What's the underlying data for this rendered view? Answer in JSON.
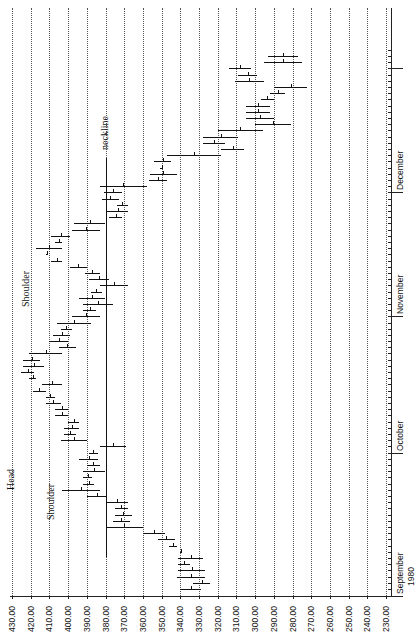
{
  "chart_data": {
    "type": "bar",
    "subtype": "high-low range (OHLC-style) chart, rotated 90 degrees: price on horizontal axis, time on vertical axis",
    "title": "",
    "xlabel": "",
    "ylabel": "",
    "price_axis": {
      "ticks": [
        "430.00",
        "420.00",
        "410.00",
        "400.00",
        "390.00",
        "380.00",
        "370.00",
        "360.00",
        "350.00",
        "340.00",
        "330.00",
        "320.00",
        "310.00",
        "300.00",
        "290.00",
        "280.00",
        "270.00",
        "260.00",
        "250.00",
        "240.00",
        "230.00"
      ],
      "range": [
        430,
        230
      ],
      "grid": true
    },
    "time_axis": {
      "labels": [
        {
          "label": "September",
          "sub": "1980",
          "index": 0
        },
        {
          "label": "October",
          "index": 22
        },
        {
          "label": "November",
          "index": 44
        },
        {
          "label": "December",
          "index": 64
        },
        {
          "label": "",
          "index": 84
        }
      ]
    },
    "annotations": [
      {
        "text": "neckline",
        "price": 380
      },
      {
        "text": "Head",
        "price": 425
      },
      {
        "text": "Shoulder",
        "price": 405,
        "position": "left-shoulder"
      },
      {
        "text": "Shoulder",
        "price": 408,
        "position": "right-shoulder"
      }
    ],
    "neckline": {
      "price": 380,
      "from_index": 1,
      "to_index": 68
    },
    "series": [
      {
        "name": "Daily range (high, low)",
        "bars": [
          [
            340,
            329
          ],
          [
            333,
            324
          ],
          [
            342,
            327
          ],
          [
            341,
            327
          ],
          [
            341,
            335
          ],
          [
            341,
            328
          ],
          [
            340,
            339
          ],
          [
            346,
            342
          ],
          [
            352,
            343
          ],
          [
            360,
            348
          ],
          [
            380,
            360
          ],
          [
            376,
            367
          ],
          [
            375,
            366
          ],
          [
            375,
            368
          ],
          [
            380,
            368
          ],
          [
            390,
            379
          ],
          [
            403,
            383
          ],
          [
            392,
            386
          ],
          [
            392,
            387
          ],
          [
            392,
            380
          ],
          [
            390,
            383
          ],
          [
            394,
            384
          ],
          [
            389,
            384
          ],
          [
            383,
            369
          ],
          [
            404,
            390
          ],
          [
            402,
            396
          ],
          [
            402,
            394
          ],
          [
            400,
            394
          ],
          [
            407,
            400
          ],
          [
            407,
            400
          ],
          [
            412,
            404
          ],
          [
            412,
            407
          ],
          [
            419,
            412
          ],
          [
            414,
            403
          ],
          [
            421,
            417
          ],
          [
            425,
            418
          ],
          [
            424,
            413
          ],
          [
            424,
            415
          ],
          [
            421,
            403
          ],
          [
            405,
            396
          ],
          [
            410,
            400
          ],
          [
            408,
            399
          ],
          [
            404,
            398
          ],
          [
            406,
            388
          ],
          [
            398,
            383
          ],
          [
            392,
            385
          ],
          [
            392,
            376
          ],
          [
            394,
            380
          ],
          [
            388,
            382
          ],
          [
            383,
            368
          ],
          [
            389,
            378
          ],
          [
            391,
            383
          ],
          [
            399,
            390
          ],
          [
            409,
            403
          ],
          [
            412,
            411
          ],
          [
            417,
            403
          ],
          [
            407,
            403
          ],
          [
            409,
            399
          ],
          [
            398,
            383
          ],
          [
            397,
            380
          ],
          [
            378,
            371
          ],
          [
            379,
            368
          ],
          [
            374,
            368
          ],
          [
            382,
            373
          ],
          [
            381,
            371
          ],
          [
            383,
            358
          ],
          [
            357,
            347
          ],
          [
            356,
            342
          ],
          [
            351,
            349
          ],
          [
            354,
            345
          ],
          [
            347,
            318
          ],
          [
            318,
            306
          ],
          [
            328,
            316
          ],
          [
            328,
            309
          ],
          [
            320,
            296
          ],
          [
            300,
            281
          ],
          [
            305,
            290
          ],
          [
            305,
            292
          ],
          [
            305,
            292
          ],
          [
            297,
            290
          ],
          [
            292,
            284
          ],
          [
            290,
            272
          ],
          [
            311,
            295
          ],
          [
            309,
            299
          ],
          [
            314,
            302
          ],
          [
            295,
            275
          ],
          [
            293,
            277
          ]
        ]
      }
    ]
  }
}
